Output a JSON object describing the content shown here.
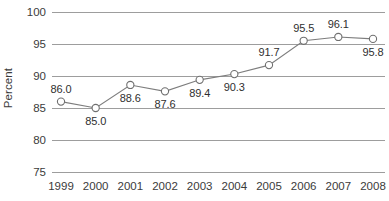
{
  "chart_data": {
    "type": "line",
    "title": "",
    "xlabel": "",
    "ylabel": "Percent",
    "categories": [
      "1999",
      "2000",
      "2001",
      "2002",
      "2003",
      "2004",
      "2005",
      "2006",
      "2007",
      "2008"
    ],
    "values": [
      86.0,
      85.0,
      88.6,
      87.6,
      89.4,
      90.3,
      91.7,
      95.5,
      96.1,
      95.8
    ],
    "data_labels": [
      "86.0",
      "85.0",
      "88.6",
      "87.6",
      "89.4",
      "90.3",
      "91.7",
      "95.5",
      "96.1",
      "95.8"
    ],
    "data_label_positions": [
      "above",
      "below",
      "below",
      "below",
      "below",
      "below",
      "above",
      "above",
      "above",
      "below"
    ],
    "ylim": [
      75,
      100
    ],
    "ytick_labels": [
      "100",
      "95",
      "90",
      "85",
      "80",
      "75"
    ],
    "ytick_values": [
      100,
      95,
      90,
      85,
      80,
      75
    ],
    "grid": true,
    "grid_axis": "y",
    "legend": "none",
    "marker": "open-circle",
    "colors": {
      "gridline": "#9d9d9d",
      "series_line": "#7d7d7d",
      "marker_stroke": "#6f6f6f",
      "marker_fill": "#ffffff",
      "text": "#3b3b3b",
      "label_text": "#2f2f2f",
      "background": "#ffffff"
    }
  }
}
